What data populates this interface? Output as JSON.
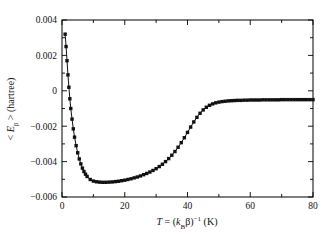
{
  "chart_data": {
    "type": "line",
    "title": "",
    "subtitle": "",
    "xlabel": "T = (kBβ)−1  (K)",
    "xlabel_parts": {
      "var": "T",
      "equals": " = (",
      "k": "k",
      "k_sub": "B",
      "beta": "β)",
      "exp": "−1",
      "unit": "  (K)"
    },
    "ylabel": "< Eβ >  (hartree)",
    "ylabel_parts": {
      "open": "< ",
      "e": "E",
      "e_sub": "β",
      "close": " >  (hartree)"
    },
    "xlim": [
      0,
      80
    ],
    "ylim": [
      -0.006,
      0.004
    ],
    "grid": false,
    "legend": null,
    "legend_position": "none",
    "xticks": [
      0,
      20,
      40,
      60,
      80
    ],
    "xtick_labels": [
      "0",
      "20",
      "40",
      "60",
      "80"
    ],
    "xminor_ticks": [
      10,
      30,
      50,
      70
    ],
    "yticks": [
      -0.006,
      -0.004,
      -0.002,
      0,
      0.002,
      0.004
    ],
    "ytick_labels": [
      "−0.006",
      "−0.004",
      "−0.002",
      "0",
      "0.002",
      "0.004"
    ],
    "yminor_ticks": [
      -0.005,
      -0.003,
      -0.001,
      0.001,
      0.003
    ],
    "marker": "square",
    "marker_size": 1.7,
    "line_color": "#111111",
    "series": [
      {
        "name": "<E_beta>",
        "x": [
          1.0,
          1.3,
          1.6,
          1.9,
          2.2,
          2.5,
          2.8,
          3.2,
          3.6,
          4.0,
          4.5,
          5.0,
          5.5,
          6.0,
          6.5,
          7.0,
          7.5,
          8.0,
          9.0,
          10.0,
          11.0,
          12.0,
          13.0,
          14.0,
          15.0,
          16.0,
          17.0,
          18.0,
          19.0,
          20.0,
          21.0,
          22.0,
          23.0,
          24.0,
          25.0,
          26.0,
          27.0,
          28.0,
          29.0,
          30.0,
          31.0,
          32.0,
          33.0,
          34.0,
          35.0,
          36.0,
          37.0,
          38.0,
          39.0,
          40.0,
          41.0,
          42.0,
          43.0,
          44.0,
          45.0,
          46.0,
          47.0,
          48.0,
          49.0,
          50.0,
          51.0,
          52.0,
          53.0,
          54.0,
          55.0,
          56.0,
          57.0,
          58.0,
          59.0,
          60.0,
          61.0,
          62.0,
          63.0,
          64.0,
          65.0,
          66.0,
          67.0,
          68.0,
          69.0,
          70.0,
          71.0,
          72.0,
          73.0,
          74.0,
          75.0,
          76.0,
          77.0,
          78.0,
          79.0,
          80.0
        ],
        "y": [
          0.0032,
          0.0025,
          0.0017,
          0.0009,
          0.0002,
          -0.00045,
          -0.001,
          -0.0016,
          -0.00215,
          -0.00262,
          -0.0031,
          -0.0035,
          -0.00385,
          -0.00413,
          -0.00437,
          -0.00456,
          -0.00471,
          -0.00484,
          -0.00501,
          -0.0051,
          -0.00514,
          -0.00516,
          -0.00517,
          -0.00517,
          -0.00516,
          -0.00515,
          -0.00513,
          -0.00511,
          -0.00508,
          -0.00505,
          -0.00501,
          -0.00497,
          -0.00492,
          -0.00487,
          -0.00481,
          -0.00474,
          -0.00467,
          -0.00459,
          -0.0045,
          -0.0044,
          -0.00428,
          -0.00415,
          -0.004,
          -0.00383,
          -0.00364,
          -0.00343,
          -0.00319,
          -0.00293,
          -0.00265,
          -0.00235,
          -0.00205,
          -0.00176,
          -0.0015,
          -0.00127,
          -0.00108,
          -0.00093,
          -0.00082,
          -0.00074,
          -0.00068,
          -0.00064,
          -0.00061,
          -0.00059,
          -0.00057,
          -0.00056,
          -0.00055,
          -0.00054,
          -0.00054,
          -0.00053,
          -0.00053,
          -0.00052,
          -0.00052,
          -0.00052,
          -0.00052,
          -0.00051,
          -0.00051,
          -0.00051,
          -0.00051,
          -0.00051,
          -0.00051,
          -0.0005,
          -0.0005,
          -0.0005,
          -0.0005,
          -0.0005,
          -0.0005,
          -0.0005,
          -0.0005,
          -0.0005,
          -0.0005,
          -0.0005
        ]
      }
    ],
    "annotations": []
  }
}
